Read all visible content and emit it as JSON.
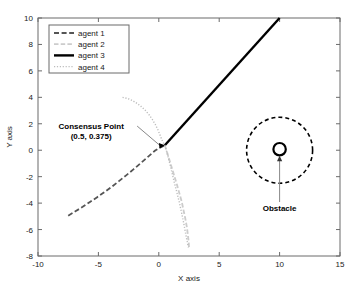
{
  "chart_data": {
    "type": "line",
    "title": "",
    "xlabel": "X axis",
    "ylabel": "Y axis",
    "xlim": [
      -10,
      15
    ],
    "ylim": [
      -8,
      10
    ],
    "xticks": [
      -10,
      -5,
      0,
      5,
      10,
      15
    ],
    "yticks": [
      -8,
      -6,
      -4,
      -2,
      0,
      2,
      4,
      6,
      8,
      10
    ],
    "xtick_labels": [
      "-10",
      "-5",
      "0",
      "5",
      "10",
      "15"
    ],
    "ytick_labels": [
      "-8",
      "-6",
      "-4",
      "-2",
      "0",
      "2",
      "4",
      "6",
      "8",
      "10"
    ],
    "grid": false,
    "legend_position": "upper-left",
    "series": [
      {
        "name": "agent 1",
        "style": "dashed",
        "color": "#555555",
        "width": 1.8,
        "points": [
          [
            -7.5,
            -4.95
          ],
          [
            -6.9,
            -4.62
          ],
          [
            -6.3,
            -4.28
          ],
          [
            -5.7,
            -3.92
          ],
          [
            -5.1,
            -3.55
          ],
          [
            -4.5,
            -3.17
          ],
          [
            -3.9,
            -2.77
          ],
          [
            -3.3,
            -2.34
          ],
          [
            -2.7,
            -1.9
          ],
          [
            -2.1,
            -1.45
          ],
          [
            -1.5,
            -0.98
          ],
          [
            -0.9,
            -0.5
          ],
          [
            -0.3,
            -0.02
          ],
          [
            0.1,
            0.2
          ],
          [
            0.5,
            0.375
          ]
        ]
      },
      {
        "name": "agent 2",
        "style": "dashdot",
        "color": "#cccccc",
        "width": 1.8,
        "points": [
          [
            0.5,
            0.375
          ],
          [
            0.7,
            -0.2
          ],
          [
            0.9,
            -0.8
          ],
          [
            1.1,
            -1.4
          ],
          [
            1.3,
            -2.0
          ],
          [
            1.5,
            -2.6
          ],
          [
            1.7,
            -3.25
          ],
          [
            1.9,
            -3.9
          ],
          [
            2.05,
            -4.55
          ],
          [
            2.2,
            -5.2
          ],
          [
            2.33,
            -5.85
          ],
          [
            2.42,
            -6.5
          ],
          [
            2.48,
            -7.0
          ],
          [
            2.5,
            -7.35
          ]
        ]
      },
      {
        "name": "agent 3",
        "style": "solid",
        "color": "#000000",
        "width": 2.4,
        "points": [
          [
            0.5,
            0.375
          ],
          [
            10.0,
            10.0
          ]
        ]
      },
      {
        "name": "agent 4",
        "style": "dotted",
        "color": "#bdbdbd",
        "width": 1.4,
        "points": [
          [
            -3.0,
            4.0
          ],
          [
            -2.55,
            3.9
          ],
          [
            -2.15,
            3.74
          ],
          [
            -1.8,
            3.54
          ],
          [
            -1.45,
            3.3
          ],
          [
            -1.12,
            3.02
          ],
          [
            -0.82,
            2.7
          ],
          [
            -0.55,
            2.35
          ],
          [
            -0.3,
            1.97
          ],
          [
            -0.08,
            1.56
          ],
          [
            0.1,
            1.15
          ],
          [
            0.26,
            0.78
          ],
          [
            0.4,
            0.52
          ],
          [
            0.5,
            0.375
          ],
          [
            0.62,
            0.0
          ],
          [
            0.78,
            -0.55
          ],
          [
            0.95,
            -1.15
          ],
          [
            1.12,
            -1.8
          ],
          [
            1.3,
            -2.5
          ],
          [
            1.5,
            -3.2
          ],
          [
            1.7,
            -3.95
          ],
          [
            1.88,
            -4.7
          ],
          [
            2.05,
            -5.45
          ],
          [
            2.2,
            -6.2
          ],
          [
            2.35,
            -6.9
          ],
          [
            2.45,
            -7.35
          ]
        ]
      }
    ],
    "annotations": [
      {
        "name": "consensus-point",
        "label_line1": "Consensus Point",
        "label_line2": "(0.5, 0.375)",
        "target": [
          0.5,
          0.375
        ],
        "text_anchor": [
          -5.6,
          1.6
        ]
      },
      {
        "name": "obstacle",
        "label_line1": "Obstacle",
        "label_line2": "",
        "target": [
          10.0,
          -0.35
        ],
        "text_anchor": [
          10.0,
          -4.6
        ]
      }
    ],
    "obstacle": {
      "center": [
        10.0,
        0.0
      ],
      "marker_radius_px": 6.2,
      "boundary_radius_px": 33,
      "boundary_style": "dashed",
      "color": "#000000"
    }
  },
  "legend": {
    "entries": [
      {
        "label": "agent 1"
      },
      {
        "label": "agent 2"
      },
      {
        "label": "agent 3"
      },
      {
        "label": "agent 4"
      }
    ]
  },
  "axes": {
    "x_title": "X axis",
    "y_title": "Y axis"
  }
}
